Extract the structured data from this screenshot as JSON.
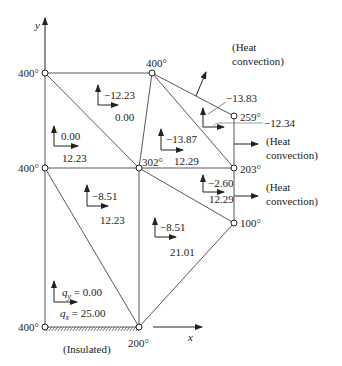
{
  "axes": {
    "x_label": "x",
    "y_label": "y"
  },
  "nodes": [
    {
      "id": "n1",
      "temp": "400°"
    },
    {
      "id": "n2",
      "temp": "400°"
    },
    {
      "id": "n3",
      "temp": "400°"
    },
    {
      "id": "n4",
      "temp": "302°"
    },
    {
      "id": "n5",
      "temp": "259°"
    },
    {
      "id": "n6",
      "temp": "203°"
    },
    {
      "id": "n7",
      "temp": "100°"
    },
    {
      "id": "n8",
      "temp": "400°"
    },
    {
      "id": "n9",
      "temp": "200°"
    }
  ],
  "elements": [
    {
      "qy": "−12.23",
      "qx": "0.00"
    },
    {
      "qy": "0.00",
      "qx": "12.23"
    },
    {
      "qy": "−13.87",
      "qx": "12.29"
    },
    {
      "qy": "−13.83",
      "qx": "−12.34"
    },
    {
      "qy": "−2.60",
      "qx": "12.29"
    },
    {
      "qy": "−8.51",
      "qx": "12.23"
    },
    {
      "qy": "−8.51",
      "qx": "21.01"
    },
    {
      "qy": "q_y = 0.00",
      "qx": "q_x = 25.00"
    }
  ],
  "bottom_element": {
    "qy_sym": "q",
    "qy_sub": "y",
    "qy_val": " = 0.00",
    "qx_sym": "q",
    "qx_sub": "x",
    "qx_val": " = 25.00"
  },
  "annotations": {
    "convection_top_1": "(Heat",
    "convection_top_2": "convection)",
    "convection_mid_1": "(Heat",
    "convection_mid_2": "convection)",
    "convection_low_1": "(Heat",
    "convection_low_2": "convection)",
    "insulated": "(Insulated)"
  }
}
